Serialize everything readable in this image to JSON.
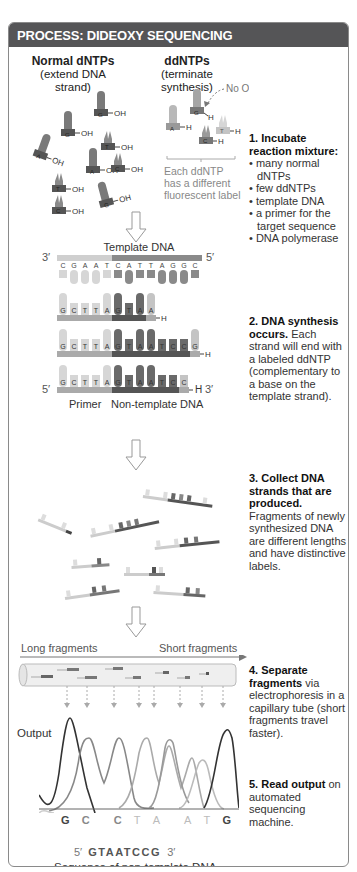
{
  "header": {
    "title": "PROCESS: DIDEOXY SEQUENCING"
  },
  "colors": {
    "header_bg": "#555557",
    "border": "#8a8a8a",
    "dark_base": "#6a6a6a",
    "mid_base": "#9a9a9a",
    "light_base": "#cfcfcf",
    "text_muted": "#888888"
  },
  "reagents": {
    "normal": {
      "title": "Normal dNTPs",
      "subtitle": "(extend DNA strand)",
      "label_oh": "OH",
      "bases": [
        "G",
        "G",
        "T",
        "A",
        "A",
        "C",
        "T",
        "G",
        "C"
      ]
    },
    "dd": {
      "title": "ddNTPs",
      "subtitle": "(terminate synthesis)",
      "no_oh": "No OH",
      "label_h": "H",
      "bases": [
        "A",
        "G",
        "C",
        "T"
      ],
      "note": [
        "Each ddNTP",
        "has a different",
        "fluorescent label"
      ]
    }
  },
  "steps": [
    {
      "number": "1.",
      "title": "Incubate reaction mixture:",
      "bullets": [
        "many normal dNTPs",
        "few ddNTPs",
        "template DNA",
        "a primer for the target sequence",
        "DNA polymerase"
      ]
    },
    {
      "number": "2.",
      "title": "DNA synthesis occurs.",
      "body": "Each strand will end with a labeled ddNTP (complementary to a base on the template strand)."
    },
    {
      "number": "3.",
      "title": "Collect DNA strands that are produced.",
      "body": "Fragments of newly synthesized DNA are different lengths and have distinctive labels."
    },
    {
      "number": "4.",
      "title": "Separate fragments",
      "body": "via electrophoresis in a capillary tube (short fragments travel faster)."
    },
    {
      "number": "5.",
      "title": "Read output",
      "body": "on automated sequencing machine."
    }
  ],
  "synthesis": {
    "template_label": "Template DNA",
    "template_3": "3′",
    "template_5": "5′",
    "template_bases": [
      "C",
      "G",
      "A",
      "A",
      "T",
      "C",
      "A",
      "T",
      "T",
      "A",
      "G",
      "G",
      "C"
    ],
    "strands": [
      {
        "bases": [
          "G",
          "C",
          "T",
          "T",
          "A",
          "G",
          "T",
          "A",
          "A"
        ],
        "end": "H"
      },
      {
        "bases": [
          "G",
          "C",
          "T",
          "T",
          "A",
          "G",
          "T",
          "A",
          "A",
          "T",
          "C",
          "C",
          "G"
        ],
        "end": "H"
      },
      {
        "bases": [
          "G",
          "C",
          "T",
          "T",
          "A",
          "G",
          "T",
          "A",
          "A",
          "T",
          "C",
          "C"
        ],
        "end": "H"
      }
    ],
    "strand_5": "5′",
    "strand_3": "3′",
    "primer_label": "Primer",
    "non_template_label": "Non-template DNA"
  },
  "electrophoresis": {
    "long_label": "Long fragments",
    "short_label": "Short fragments"
  },
  "output": {
    "label": "Output",
    "read_bases": [
      "G",
      "C",
      "C",
      "T",
      "A",
      "A",
      "T",
      "G"
    ],
    "sequence_5": "5′",
    "sequence": "GTAATCCG",
    "sequence_3": "3′",
    "caption": "Sequence of non-template DNA"
  }
}
